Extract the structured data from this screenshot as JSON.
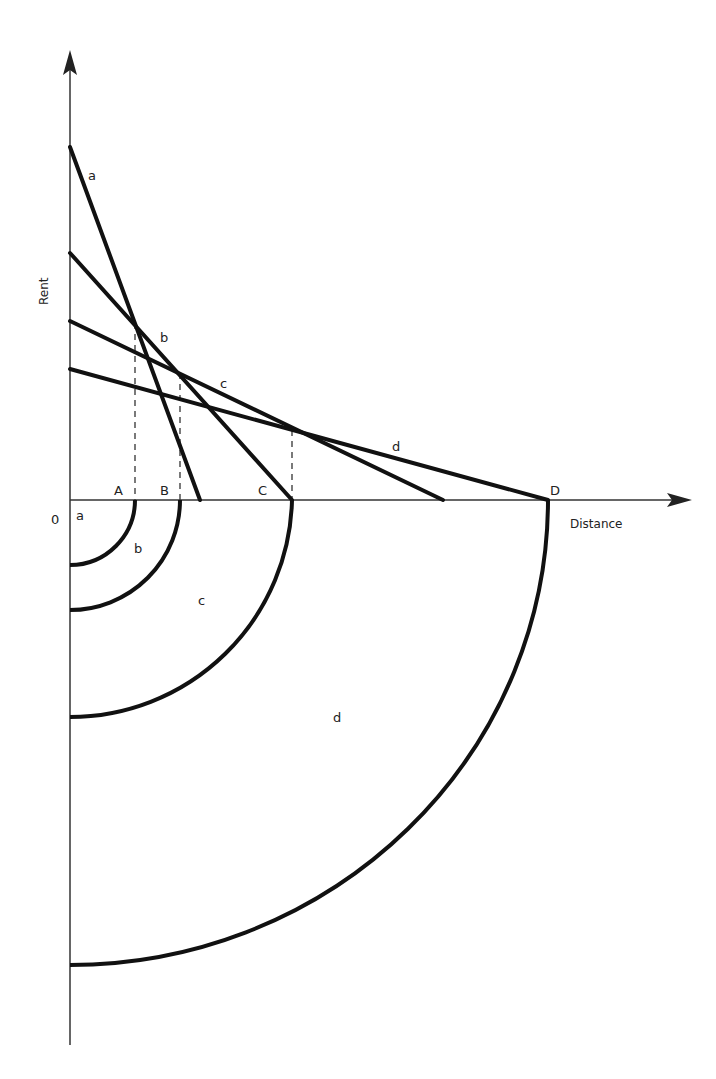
{
  "diagram": {
    "axes": {
      "y_label": "Rent",
      "x_label": "Distance",
      "origin_label": "0"
    },
    "bid_rent_lines": [
      {
        "label": "a",
        "y_intercept_px": 147,
        "x_intercept_px": 200
      },
      {
        "label": "b",
        "y_intercept_px": 253,
        "x_intercept_px": 292
      },
      {
        "label": "c",
        "y_intercept_px": 321,
        "x_intercept_px": 443
      },
      {
        "label": "d",
        "y_intercept_px": 369,
        "x_intercept_px": 548
      }
    ],
    "boundary_points": [
      {
        "label": "A",
        "x_px": 135
      },
      {
        "label": "B",
        "x_px": 180
      },
      {
        "label": "C",
        "x_px": 292
      },
      {
        "label": "D",
        "x_px": 548
      }
    ],
    "zones": [
      {
        "label": "a"
      },
      {
        "label": "b"
      },
      {
        "label": "c"
      },
      {
        "label": "d"
      }
    ],
    "colors": {
      "line": "#111111",
      "axis": "#333333",
      "text": "#222222",
      "background": "#ffffff"
    }
  }
}
